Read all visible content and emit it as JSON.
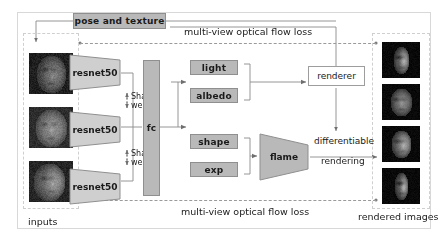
{
  "figure": {
    "type": "diagram",
    "background": "#ffffff",
    "colors": {
      "block_fill": "#b9b9b9",
      "block_stroke": "#8f8f8f",
      "wire": "#8a8a8a",
      "dashed_group": "#cfcfcf",
      "text": "#1a1a1a"
    }
  },
  "blocks": {
    "pose_texture": "pose and texture",
    "light": "light",
    "albedo": "albedo",
    "shape": "shape",
    "exp": "exp",
    "renderer": "renderer",
    "flame": "flame",
    "fc": "fc",
    "resnet": "resnet50"
  },
  "encoders": [
    {
      "label": "resnet50"
    },
    {
      "label": "resnet50"
    },
    {
      "label": "resnet50"
    }
  ],
  "shared_weight_labels": [
    {
      "line1": "Shared",
      "line2": "weight"
    },
    {
      "line1": "Shared",
      "line2": "weight"
    }
  ],
  "losses": {
    "top": "multi-view optical flow loss",
    "bottom": "multi-view optical flow loss"
  },
  "annotations": {
    "differentiable": "differentiable",
    "rendering": "rendering"
  },
  "group_labels": {
    "inputs": "inputs",
    "rendered_images": "rendered images"
  },
  "input_images": [
    {
      "name": "input-face-1",
      "description": "dark grayscale face photo, frontal-left"
    },
    {
      "name": "input-face-2",
      "description": "dark grayscale face photo, frontal"
    },
    {
      "name": "input-face-3",
      "description": "dark grayscale face photo, profile"
    }
  ],
  "rendered_images": [
    {
      "name": "rendered-face-1",
      "description": "rendered face, side view on black"
    },
    {
      "name": "rendered-face-2",
      "description": "rendered face, frontal view on black"
    },
    {
      "name": "rendered-face-3",
      "description": "rendered face, three-quarter view on black"
    },
    {
      "name": "rendered-face-4",
      "description": "rendered face, profile view on black"
    }
  ]
}
